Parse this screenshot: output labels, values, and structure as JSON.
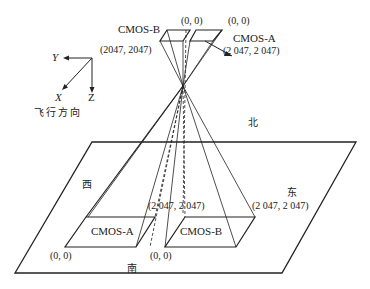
{
  "diagram": {
    "type": "CMOS dual-sensor ground projection schematic",
    "colors": {
      "line": "#222222",
      "background": "#ffffff"
    },
    "axes": {
      "x_label": "X",
      "y_label": "Y",
      "z_label": "Z",
      "caption": "飞行方向"
    },
    "sensors_top": {
      "cmos_b": {
        "label": "CMOS-B",
        "corner_origin": "(0, 0)",
        "corner_max": "(2047, 2047)"
      },
      "cmos_a": {
        "label": "CMOS-A",
        "corner_origin": "(0, 0)",
        "corner_max": "(2 047, 2 047)"
      }
    },
    "directions": {
      "north": "北",
      "south": "南",
      "east": "东",
      "west": "西"
    },
    "ground": {
      "cmos_a": {
        "label": "CMOS-A",
        "corner_origin": "(0, 0)"
      },
      "cmos_b": {
        "label": "CMOS-B",
        "corner_origin": "(0, 0)",
        "corner_max": "(2 047, 2 047)"
      },
      "shared_corner": "(2 047, 2 047)"
    }
  }
}
